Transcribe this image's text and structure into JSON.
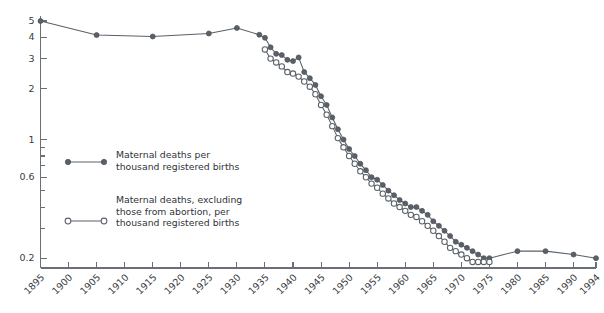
{
  "chart_data": {
    "type": "line",
    "title": "",
    "xlabel": "",
    "ylabel": "",
    "scale_y": "log",
    "grid": false,
    "legend_position": "inside-left-center",
    "xlim": [
      1895,
      1994
    ],
    "ylim": [
      0.18,
      5.2
    ],
    "y_ticks": [
      5,
      4,
      3,
      2,
      1,
      0.6,
      0.2
    ],
    "y_tick_labels": [
      "5",
      "4",
      "3",
      "2",
      "1",
      "0.6",
      "0.2"
    ],
    "y_minor_ticks": [
      0.9,
      0.8,
      0.7,
      0.5,
      0.4,
      0.3
    ],
    "x_ticks": [
      1895,
      1900,
      1905,
      1910,
      1915,
      1920,
      1925,
      1930,
      1935,
      1940,
      1945,
      1950,
      1955,
      1960,
      1965,
      1970,
      1975,
      1980,
      1985,
      1990,
      1994
    ],
    "x_tick_labels": [
      "1895",
      "1900",
      "1905",
      "1910",
      "1915",
      "1920",
      "1925",
      "1930",
      "1935",
      "1940",
      "1945",
      "1950",
      "1955",
      "1960",
      "1965",
      "1970",
      "1975",
      "1980",
      "1985",
      "1990",
      "1994"
    ],
    "series": [
      {
        "name": "Maternal deaths per thousand registered births",
        "marker": "filled-circle",
        "color": "#5a6068",
        "x": [
          1895,
          1905,
          1915,
          1925,
          1930,
          1934,
          1935,
          1936,
          1937,
          1938,
          1939,
          1940,
          1941,
          1942,
          1943,
          1944,
          1945,
          1946,
          1947,
          1948,
          1949,
          1950,
          1951,
          1952,
          1953,
          1954,
          1955,
          1956,
          1957,
          1958,
          1959,
          1960,
          1961,
          1962,
          1963,
          1964,
          1965,
          1966,
          1967,
          1968,
          1969,
          1970,
          1971,
          1972,
          1973,
          1974,
          1975,
          1980,
          1985,
          1990,
          1994
        ],
        "values": [
          5.0,
          4.13,
          4.05,
          4.22,
          4.55,
          4.15,
          3.98,
          3.5,
          3.2,
          3.15,
          2.95,
          2.9,
          3.05,
          2.5,
          2.3,
          2.1,
          1.8,
          1.6,
          1.35,
          1.15,
          1.0,
          0.88,
          0.8,
          0.72,
          0.66,
          0.6,
          0.58,
          0.54,
          0.5,
          0.47,
          0.44,
          0.42,
          0.4,
          0.4,
          0.38,
          0.36,
          0.33,
          0.31,
          0.29,
          0.27,
          0.25,
          0.24,
          0.23,
          0.22,
          0.21,
          0.2,
          0.2,
          0.22,
          0.22,
          0.21,
          0.2
        ]
      },
      {
        "name": "Maternal deaths, excluding those from abortion, per thousand registered births",
        "marker": "open-circle",
        "color": "#5a6068",
        "x": [
          1935,
          1936,
          1937,
          1938,
          1939,
          1940,
          1941,
          1942,
          1943,
          1944,
          1945,
          1946,
          1947,
          1948,
          1949,
          1950,
          1951,
          1952,
          1953,
          1954,
          1955,
          1956,
          1957,
          1958,
          1959,
          1960,
          1961,
          1962,
          1963,
          1964,
          1965,
          1966,
          1967,
          1968,
          1969,
          1970,
          1971,
          1972,
          1973,
          1974,
          1975
        ],
        "values": [
          3.4,
          3.0,
          2.85,
          2.7,
          2.5,
          2.45,
          2.35,
          2.2,
          2.05,
          1.85,
          1.6,
          1.4,
          1.2,
          1.02,
          0.9,
          0.8,
          0.72,
          0.65,
          0.6,
          0.55,
          0.52,
          0.48,
          0.45,
          0.42,
          0.4,
          0.38,
          0.36,
          0.35,
          0.33,
          0.31,
          0.29,
          0.27,
          0.25,
          0.23,
          0.22,
          0.21,
          0.2,
          0.19,
          0.19,
          0.19,
          0.19
        ]
      }
    ],
    "legend": [
      {
        "marker": "filled-circle",
        "lines": [
          "Maternal deaths per",
          "thousand registered births"
        ]
      },
      {
        "marker": "open-circle",
        "lines": [
          "Maternal deaths, excluding",
          "those from abortion, per",
          "thousand registered births"
        ]
      }
    ],
    "colors": {
      "marker": "#5a6068",
      "axis": "#6a6f76",
      "text": "#2f3237",
      "background": "#ffffff"
    }
  }
}
